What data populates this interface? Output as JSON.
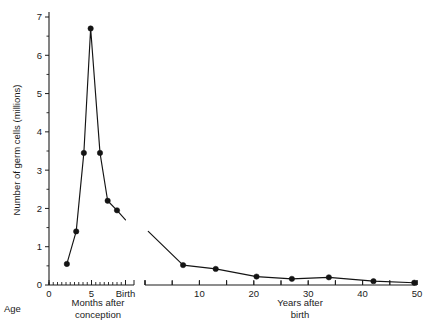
{
  "chart_data": {
    "type": "line",
    "title": "",
    "ylabel": "Number of germ cells (millions)",
    "ylim": [
      0,
      7
    ],
    "ytick_values": [
      0,
      1,
      2,
      3,
      4,
      5,
      6,
      7
    ],
    "ytick_labels": [
      "0",
      "1",
      "2",
      "3",
      "4",
      "5",
      "6",
      "7"
    ],
    "y_minor_step": 0.5,
    "grid": false,
    "legend": "none",
    "corner_label": "Age",
    "panels": [
      {
        "name": "months-after-conception",
        "xlabel_line1": "Months after",
        "xlabel_line2": "conception",
        "xlim": [
          0,
          10
        ],
        "xtick_values": [
          0,
          5,
          9
        ],
        "xtick_labels": [
          "0",
          "5",
          "Birth"
        ],
        "x_minor_step": 0.5,
        "series": [
          {
            "name": "germ-cells-prenatal",
            "x": [
              2.1,
              3.2,
              4.1,
              4.9,
              6.0,
              6.9,
              8.0,
              9.0
            ],
            "y": [
              0.55,
              1.4,
              3.45,
              6.7,
              3.45,
              2.2,
              1.95,
              1.7
            ],
            "markers": [
              true,
              true,
              true,
              true,
              true,
              true,
              true,
              false
            ]
          }
        ]
      },
      {
        "name": "years-after-birth",
        "xlabel_line1": "Years after",
        "xlabel_line2": "birth",
        "xlim": [
          0,
          50
        ],
        "xtick_values": [
          0,
          5,
          10,
          15,
          20,
          25,
          30,
          35,
          40,
          45,
          50
        ],
        "xtick_labels": [
          "",
          "",
          "10",
          "",
          "20",
          "",
          "30",
          "",
          "40",
          "",
          "50"
        ],
        "series": [
          {
            "name": "germ-cells-postnatal",
            "x": [
              0.6,
              7.0,
              13.0,
              20.5,
              27.0,
              33.8,
              42.0,
              49.5
            ],
            "y": [
              1.4,
              0.52,
              0.42,
              0.22,
              0.16,
              0.2,
              0.1,
              0.06
            ],
            "markers": [
              false,
              true,
              true,
              true,
              true,
              true,
              true,
              true
            ]
          }
        ]
      }
    ]
  }
}
